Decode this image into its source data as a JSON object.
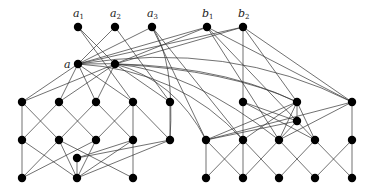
{
  "diagram": {
    "width": 373,
    "height": 188,
    "node_radius": 4.2,
    "labels": [
      {
        "id": "a1",
        "text": "a",
        "sub": "1",
        "x": 73,
        "y": 17
      },
      {
        "id": "a2",
        "text": "a",
        "sub": "2",
        "x": 110,
        "y": 17
      },
      {
        "id": "a3",
        "text": "a",
        "sub": "3",
        "x": 147,
        "y": 17
      },
      {
        "id": "b1",
        "text": "b",
        "sub": "1",
        "x": 202,
        "y": 17
      },
      {
        "id": "b2",
        "text": "b",
        "sub": "2",
        "x": 238,
        "y": 17
      },
      {
        "id": "a",
        "text": "a",
        "sub": "",
        "x": 64,
        "y": 68
      }
    ],
    "nodes": [
      {
        "id": "a1",
        "x": 78,
        "y": 27
      },
      {
        "id": "a2",
        "x": 115,
        "y": 27
      },
      {
        "id": "a3",
        "x": 152,
        "y": 27
      },
      {
        "id": "b1",
        "x": 207,
        "y": 27
      },
      {
        "id": "b2",
        "x": 243,
        "y": 27
      },
      {
        "id": "a",
        "x": 78,
        "y": 64
      },
      {
        "id": "ap",
        "x": 115,
        "y": 64
      },
      {
        "id": "L1a",
        "x": 22,
        "y": 102
      },
      {
        "id": "L1b",
        "x": 59,
        "y": 102
      },
      {
        "id": "L1c",
        "x": 96,
        "y": 102
      },
      {
        "id": "L1d",
        "x": 133,
        "y": 102
      },
      {
        "id": "L1e",
        "x": 170,
        "y": 102
      },
      {
        "id": "L2a",
        "x": 22,
        "y": 140
      },
      {
        "id": "L2b",
        "x": 59,
        "y": 140
      },
      {
        "id": "L2c",
        "x": 96,
        "y": 140
      },
      {
        "id": "L2d",
        "x": 133,
        "y": 140
      },
      {
        "id": "L2e",
        "x": 170,
        "y": 140
      },
      {
        "id": "Ls",
        "x": 77,
        "y": 158
      },
      {
        "id": "L3a",
        "x": 22,
        "y": 178
      },
      {
        "id": "L3b",
        "x": 77,
        "y": 178
      },
      {
        "id": "L3c",
        "x": 133,
        "y": 178
      },
      {
        "id": "R1a",
        "x": 243,
        "y": 102
      },
      {
        "id": "R1b",
        "x": 297,
        "y": 102
      },
      {
        "id": "R1c",
        "x": 352,
        "y": 102
      },
      {
        "id": "Rs",
        "x": 297,
        "y": 121
      },
      {
        "id": "R2a",
        "x": 206,
        "y": 140
      },
      {
        "id": "R2b",
        "x": 243,
        "y": 140
      },
      {
        "id": "R2c",
        "x": 279,
        "y": 140
      },
      {
        "id": "R2d",
        "x": 315,
        "y": 140
      },
      {
        "id": "R2e",
        "x": 352,
        "y": 140
      },
      {
        "id": "R3a",
        "x": 206,
        "y": 178
      },
      {
        "id": "R3b",
        "x": 243,
        "y": 178
      },
      {
        "id": "R3c",
        "x": 279,
        "y": 178
      },
      {
        "id": "R3d",
        "x": 315,
        "y": 178
      },
      {
        "id": "R3e",
        "x": 352,
        "y": 178
      }
    ],
    "edges": [
      [
        "a1",
        "ap"
      ],
      [
        "a2",
        "a"
      ],
      [
        "a1",
        "L1d"
      ],
      [
        "a2",
        "L1e"
      ],
      [
        "a3",
        "a"
      ],
      [
        "a3",
        "R2b"
      ],
      [
        "a3",
        "R2a"
      ],
      [
        "b1",
        "a"
      ],
      [
        "b1",
        "ap"
      ],
      [
        "b2",
        "a"
      ],
      [
        "b2",
        "ap"
      ],
      [
        "b1",
        "R2c"
      ],
      [
        "b1",
        "R1c"
      ],
      [
        "b1",
        "R2d"
      ],
      [
        "b2",
        "R1a"
      ],
      [
        "b2",
        "R1b"
      ],
      [
        "b2",
        "R1c"
      ],
      [
        "a",
        "L1a"
      ],
      [
        "a",
        "L1b"
      ],
      [
        "a",
        "L1c"
      ],
      [
        "a",
        "L1d"
      ],
      [
        "ap",
        "L1a"
      ],
      [
        "ap",
        "L1b"
      ],
      [
        "ap",
        "L1c"
      ],
      [
        "ap",
        "L1e"
      ],
      [
        "L1a",
        "L2a"
      ],
      [
        "L1a",
        "L2b"
      ],
      [
        "L1b",
        "L2a"
      ],
      [
        "L1b",
        "L2c"
      ],
      [
        "L1c",
        "L2b"
      ],
      [
        "L1c",
        "L2d"
      ],
      [
        "L1d",
        "L2c"
      ],
      [
        "L1d",
        "L2d"
      ],
      [
        "L1d",
        "L2e"
      ],
      [
        "L1e",
        "L2e"
      ],
      [
        "L2a",
        "L3a"
      ],
      [
        "L2a",
        "L3b"
      ],
      [
        "L2b",
        "L3a"
      ],
      [
        "L2b",
        "L3c"
      ],
      [
        "L2c",
        "L3b"
      ],
      [
        "L2c",
        "L3a"
      ],
      [
        "L2d",
        "L3b"
      ],
      [
        "L2d",
        "L3c"
      ],
      [
        "L2e",
        "L3b"
      ],
      [
        "Ls",
        "L2d"
      ],
      [
        "Ls",
        "L3b"
      ],
      [
        "Ls",
        "L2e"
      ],
      [
        "L2b",
        "L3b"
      ],
      [
        "R1a",
        "R2b"
      ],
      [
        "R1a",
        "R2d"
      ],
      [
        "R1a",
        "Rs"
      ],
      [
        "R1b",
        "R2a"
      ],
      [
        "R1b",
        "R2b"
      ],
      [
        "R1b",
        "R2c"
      ],
      [
        "R1b",
        "R2d"
      ],
      [
        "R1b",
        "Rs"
      ],
      [
        "R1c",
        "R2c"
      ],
      [
        "R1c",
        "R2e"
      ],
      [
        "R1c",
        "R2a"
      ],
      [
        "Rs",
        "R2a"
      ],
      [
        "Rs",
        "R2c"
      ],
      [
        "R2a",
        "R3a"
      ],
      [
        "R2a",
        "R3b"
      ],
      [
        "R2b",
        "R3b"
      ],
      [
        "R2b",
        "R3c"
      ],
      [
        "R2b",
        "R3a"
      ],
      [
        "R2c",
        "R3b"
      ],
      [
        "R2c",
        "R3d"
      ],
      [
        "R2d",
        "R3c"
      ],
      [
        "R2d",
        "R3e"
      ],
      [
        "R2e",
        "R3d"
      ],
      [
        "R2e",
        "R3e"
      ]
    ],
    "curves": [
      {
        "from": "a",
        "to": "R1b",
        "cx": 210,
        "cy": 60
      },
      {
        "from": "ap",
        "to": "R1b",
        "cx": 230,
        "cy": 70
      },
      {
        "from": "a",
        "to": "R2b",
        "cx": 180,
        "cy": 70
      },
      {
        "from": "ap",
        "to": "R2c",
        "cx": 190,
        "cy": 70
      },
      {
        "from": "a",
        "to": "R1c",
        "cx": 230,
        "cy": 40
      },
      {
        "from": "ap",
        "to": "R2a",
        "cx": 175,
        "cy": 80
      },
      {
        "from": "a3",
        "to": "L2e",
        "cx": 175,
        "cy": 60
      }
    ]
  }
}
